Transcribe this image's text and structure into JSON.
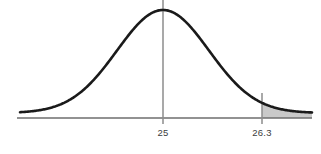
{
  "figure": {
    "background_color": "#ffffff",
    "width": 321,
    "height": 154
  },
  "chart_data": {
    "type": "line",
    "title": "",
    "subtitle": "",
    "xlabel": "",
    "ylabel": "",
    "distribution": "normal",
    "mean": 25,
    "curve_color": "#1a1a1a",
    "curve_line_width": 2.6,
    "axis": {
      "show": true,
      "color": "#6e6e6e",
      "line_width": 1.6,
      "y_pixel": 118,
      "x_start_pixel": 17,
      "x_end_pixel": 312,
      "grid": false
    },
    "tick_labels": [
      {
        "text": "25",
        "value": 25,
        "x_pixel": 163,
        "label_y_pixel": 136
      },
      {
        "text": "26.3",
        "value": 26.3,
        "x_pixel": 262,
        "label_y_pixel": 136
      }
    ],
    "vertical_lines": [
      {
        "name": "mean-line",
        "value": 25,
        "x_pixel": 163,
        "y_top_pixel": 0,
        "y_bottom_pixel": 124,
        "color": "#8c8c8c",
        "line_width": 1.5
      },
      {
        "name": "cutoff-line",
        "value": 26.3,
        "x_pixel": 262,
        "y_top_pixel": 93,
        "y_bottom_pixel": 124,
        "color": "#8c8c8c",
        "line_width": 1.5
      }
    ],
    "shaded_region": {
      "name": "right-tail-area",
      "from_value": 26.3,
      "to_value": null,
      "from_x_pixel": 262,
      "to_x_pixel": 312,
      "fill_color": "#c9c9c9",
      "side": "right"
    },
    "curve_geometry": {
      "peak_x_pixel": 163,
      "peak_y_pixel": 10,
      "baseline_y_pixel": 113,
      "sigma_pixel": 46,
      "x_start_pixel": 20,
      "x_end_pixel": 312
    },
    "legend": {
      "show": false
    }
  }
}
